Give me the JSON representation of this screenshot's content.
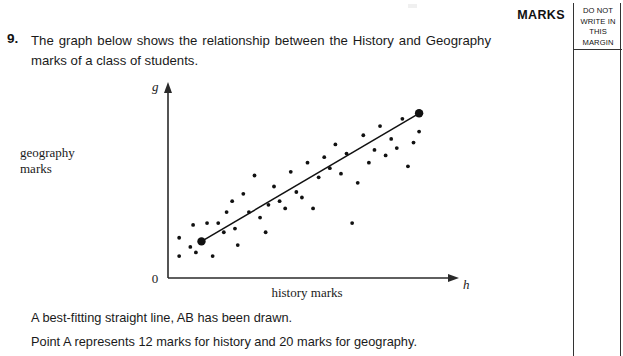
{
  "marks_column": {
    "marks_label": "MARKS",
    "margin_note_lines": [
      "DO NOT",
      "WRITE IN",
      "THIS",
      "MARGIN"
    ]
  },
  "question": {
    "number": "9.",
    "stem": "The graph below shows the relationship between the History and Geography marks of a class of students."
  },
  "statements": {
    "line1": "A best-fitting straight line, AB has been drawn.",
    "line2": "Point A represents 12 marks for history and 20 marks for geography."
  },
  "chart_data": {
    "type": "scatter",
    "title": "",
    "xlabel": "history marks",
    "ylabel": "geography marks",
    "x_axis_variable": "h",
    "y_axis_variable": "g",
    "origin_label": "0",
    "grid": false,
    "legend": false,
    "xlim": [
      0,
      100
    ],
    "ylim": [
      0,
      100
    ],
    "points": [
      [
        4,
        22
      ],
      [
        4,
        12
      ],
      [
        8,
        17
      ],
      [
        9,
        29
      ],
      [
        10,
        14
      ],
      [
        12,
        20
      ],
      [
        14,
        30
      ],
      [
        16,
        12
      ],
      [
        18,
        30
      ],
      [
        20,
        25
      ],
      [
        21,
        36
      ],
      [
        23,
        42
      ],
      [
        24,
        27
      ],
      [
        25,
        18
      ],
      [
        27,
        46
      ],
      [
        29,
        36
      ],
      [
        31,
        56
      ],
      [
        33,
        33
      ],
      [
        35,
        25
      ],
      [
        36,
        40
      ],
      [
        38,
        50
      ],
      [
        40,
        42
      ],
      [
        42,
        38
      ],
      [
        44,
        58
      ],
      [
        46,
        47
      ],
      [
        48,
        44
      ],
      [
        50,
        63
      ],
      [
        52,
        38
      ],
      [
        54,
        55
      ],
      [
        56,
        66
      ],
      [
        58,
        60
      ],
      [
        60,
        73
      ],
      [
        62,
        57
      ],
      [
        64,
        68
      ],
      [
        66,
        30
      ],
      [
        68,
        52
      ],
      [
        70,
        78
      ],
      [
        72,
        63
      ],
      [
        74,
        70
      ],
      [
        76,
        83
      ],
      [
        78,
        67
      ],
      [
        80,
        76
      ],
      [
        82,
        71
      ],
      [
        84,
        87
      ],
      [
        86,
        61
      ],
      [
        88,
        74
      ],
      [
        90,
        80
      ]
    ],
    "best_fit_line": {
      "label": "AB",
      "point_a": {
        "label": "A",
        "h": 12,
        "g": 20
      },
      "point_b": {
        "label": "B",
        "h": 90,
        "g": 90
      }
    }
  }
}
